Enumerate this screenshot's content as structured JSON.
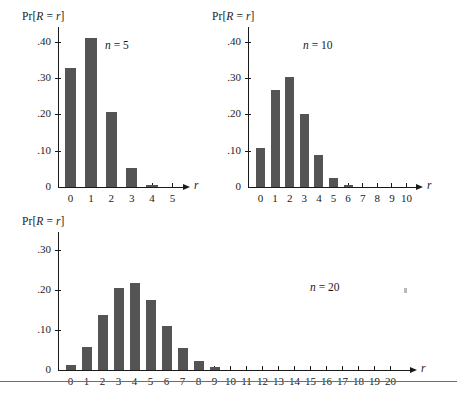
{
  "figure": {
    "background": "#ffffff",
    "bar_color": "#545454",
    "axis_color": "#1a1a1a",
    "rule_color": "#6e6e6e",
    "axis_caption": "Pr[R = r]",
    "axis_caption_prefix": "Pr[",
    "axis_caption_var1": "R",
    "axis_caption_mid": " = ",
    "axis_caption_var2": "r",
    "axis_caption_suffix": "]",
    "x_axis_symbol": "r",
    "n_prefix": "n",
    "n_equals": " = "
  },
  "chart_data": [
    {
      "type": "bar",
      "title": "n = 5",
      "n_value": "5",
      "distribution": "Binomial(n=5, p=0.2)",
      "xlabel": "r",
      "ylabel": "Pr[R = r]",
      "categories": [
        "0",
        "1",
        "2",
        "3",
        "4",
        "5"
      ],
      "values": [
        0.328,
        0.41,
        0.205,
        0.051,
        0.006,
        0.0
      ],
      "yticks": [
        0.4,
        0.3,
        0.2,
        0.1,
        0.0
      ],
      "ytick_labels": [
        ".40",
        ".30",
        ".20",
        ".10",
        "0"
      ],
      "xtick_labels": [
        "0",
        "1",
        "2",
        "3",
        "4",
        "5"
      ],
      "ylim": [
        0,
        0.44
      ],
      "grid": false,
      "legend": false
    },
    {
      "type": "bar",
      "title": "n = 10",
      "n_value": "10",
      "distribution": "Binomial(n=10, p=0.2)",
      "xlabel": "r",
      "ylabel": "Pr[R = r]",
      "categories": [
        "0",
        "1",
        "2",
        "3",
        "4",
        "5",
        "6",
        "7",
        "8",
        "9",
        "10"
      ],
      "values": [
        0.107,
        0.268,
        0.302,
        0.201,
        0.088,
        0.026,
        0.006,
        0.0,
        0.0,
        0.0,
        0.0
      ],
      "yticks": [
        0.4,
        0.3,
        0.2,
        0.1,
        0.0
      ],
      "ytick_labels": [
        ".40",
        ".30",
        ".20",
        ".10",
        "0"
      ],
      "xtick_labels": [
        "0",
        "1",
        "2",
        "3",
        "4",
        "5",
        "6",
        "7",
        "8",
        "9",
        "10"
      ],
      "ylim": [
        0,
        0.44
      ],
      "grid": false,
      "legend": false
    },
    {
      "type": "bar",
      "title": "n = 20",
      "n_value": "20",
      "distribution": "Binomial(n=20, p=0.2)",
      "xlabel": "r",
      "ylabel": "Pr[R = r]",
      "categories": [
        "0",
        "1",
        "2",
        "3",
        "4",
        "5",
        "6",
        "7",
        "8",
        "9",
        "10",
        "11",
        "12",
        "13",
        "14",
        "15",
        "16",
        "17",
        "18",
        "19",
        "20"
      ],
      "values": [
        0.012,
        0.058,
        0.137,
        0.205,
        0.218,
        0.175,
        0.109,
        0.055,
        0.022,
        0.007,
        0.0,
        0.0,
        0.0,
        0.0,
        0.0,
        0.0,
        0.0,
        0.0,
        0.0,
        0.0,
        0.0
      ],
      "yticks": [
        0.3,
        0.2,
        0.1,
        0.0
      ],
      "ytick_labels": [
        ".30",
        ".20",
        ".10",
        "0"
      ],
      "xtick_labels": [
        "0",
        "1",
        "2",
        "3",
        "4",
        "5",
        "6",
        "7",
        "8",
        "9",
        "10",
        "11",
        "12",
        "13",
        "14",
        "15",
        "16",
        "17",
        "18",
        "19",
        "20"
      ],
      "ylim": [
        0,
        0.345
      ],
      "grid": false,
      "legend": false
    }
  ]
}
